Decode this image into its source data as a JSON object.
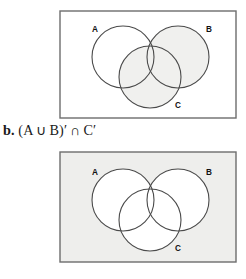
{
  "figures": [
    {
      "id": "figure-a",
      "caption": "",
      "universe_shaded": false,
      "universe_fill": "#ffffff",
      "border_color": "#6d6d6d",
      "circle_stroke": "#4a4a4a",
      "shade_fill": "#f0f0ee",
      "shaded_sets": "B union C",
      "labels": [
        {
          "text": "A",
          "x": 36,
          "y": 22
        },
        {
          "text": "B",
          "x": 150,
          "y": 22
        },
        {
          "text": "C",
          "x": 119,
          "y": 98
        }
      ],
      "circles": [
        {
          "name": "A",
          "cx": 64,
          "cy": 47,
          "r": 31,
          "shaded": false
        },
        {
          "name": "B",
          "cx": 119,
          "cy": 47,
          "r": 31,
          "shaded": true
        },
        {
          "name": "C",
          "cx": 91,
          "cy": 67,
          "r": 31,
          "shaded": true
        }
      ]
    },
    {
      "id": "figure-b",
      "caption": "",
      "universe_shaded": true,
      "universe_fill": "#eeeeec",
      "border_color": "#6d6d6d",
      "circle_stroke": "#4a4a4a",
      "shade_fill": "#eeeeec",
      "shaded_sets": "outside A union B union C",
      "labels": [
        {
          "text": "A",
          "x": 36,
          "y": 24
        },
        {
          "text": "B",
          "x": 150,
          "y": 24
        },
        {
          "text": "C",
          "x": 119,
          "y": 100
        }
      ],
      "circles": [
        {
          "name": "A",
          "cx": 64,
          "cy": 49,
          "r": 31,
          "shaded": false
        },
        {
          "name": "B",
          "cx": 119,
          "cy": 49,
          "r": 31,
          "shaded": false
        },
        {
          "name": "C",
          "cx": 91,
          "cy": 69,
          "r": 31,
          "shaded": false
        }
      ]
    }
  ],
  "expression": {
    "item_label": "b.",
    "open_paren": "(",
    "set_a": "A",
    "union_symbol": "∪",
    "set_b": "B",
    "close_paren": ")",
    "prime_1": "′",
    "intersect_symbol": "∩",
    "set_c": "C",
    "prime_2": "′",
    "full_text": "b. (A ∪ B)′ ∩ C′"
  }
}
